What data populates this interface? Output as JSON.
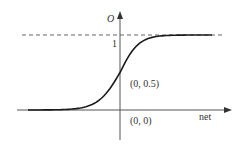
{
  "chart_data": {
    "type": "line",
    "title": "",
    "xlabel": "net",
    "ylabel": "O",
    "series": [
      {
        "name": "sigmoid",
        "function": "O = 1 / (1 + e^(-net))",
        "x": [
          -6,
          -4,
          -3,
          -2,
          -1,
          0,
          1,
          2,
          3,
          4,
          6
        ],
        "values": [
          0.0025,
          0.018,
          0.047,
          0.119,
          0.269,
          0.5,
          0.731,
          0.881,
          0.953,
          0.982,
          0.9975
        ]
      }
    ],
    "asymptote": {
      "y": 1,
      "style": "dashed"
    },
    "ticks": {
      "y": [
        "1"
      ]
    },
    "annotations": [
      {
        "text": "(0, 0.5)",
        "x": 0,
        "y": 0.5
      },
      {
        "text": "(0, 0)",
        "x": 0,
        "y": 0
      }
    ],
    "xlim": [
      -6.5,
      7
    ],
    "ylim": [
      -0.3,
      1.6
    ],
    "grid": false,
    "legend": "none"
  },
  "labels": {
    "y_axis": "O",
    "x_axis": "net",
    "one_tick": "1",
    "mid_point": "(0, 0.5)",
    "origin": "(0, 0)"
  },
  "colors": {
    "curve": "#1a1a1a",
    "axis": "#555555",
    "dashed": "#666666"
  }
}
